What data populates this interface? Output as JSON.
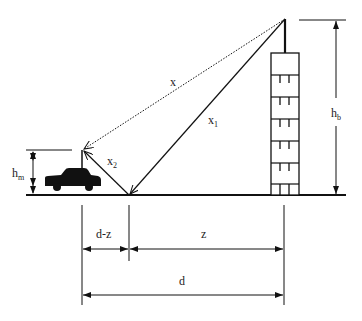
{
  "diagram": {
    "type": "two-ray ground reflection model",
    "colors": {
      "line": "#111111",
      "background": "#ffffff"
    },
    "labels": {
      "x": "x",
      "x1": "x",
      "x1_sub": "1",
      "x2": "x",
      "x2_sub": "2",
      "hm": "h",
      "hm_sub": "m",
      "hb": "h",
      "hb_sub": "b",
      "d_minus_z": "d-z",
      "z": "z",
      "d": "d"
    },
    "elements": {
      "building": "tall building with rooftop antenna (base station)",
      "car": "car with antenna (mobile station)",
      "direct_ray": "dotted line x from base antenna to mobile antenna",
      "reflected_ray_1": "solid line x1 from base antenna to ground reflection point",
      "reflected_ray_2": "solid line x2 from reflection point to mobile antenna"
    }
  }
}
